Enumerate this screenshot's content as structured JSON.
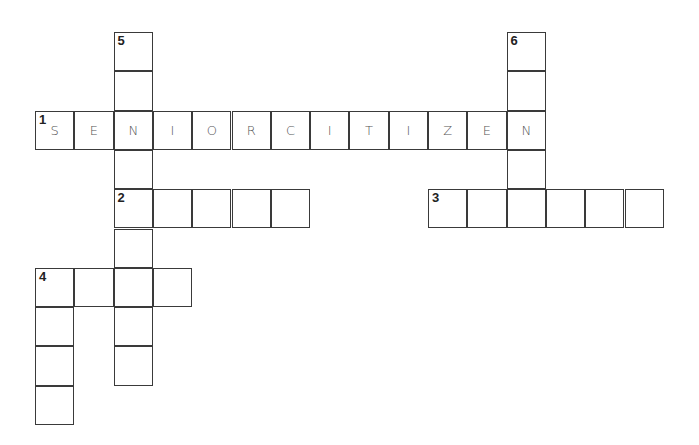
{
  "puzzle": {
    "cell_size": 39.3,
    "origin": {
      "x": 35,
      "y": 32
    },
    "entries": [
      {
        "number": "1",
        "direction": "across",
        "row": 2,
        "col": 0,
        "length": 13,
        "answer_shown": "SENIORCITIZEN"
      },
      {
        "number": "2",
        "direction": "across",
        "row": 4,
        "col": 2,
        "length": 5,
        "answer_shown": ""
      },
      {
        "number": "3",
        "direction": "across",
        "row": 4,
        "col": 10,
        "length": 6,
        "answer_shown": ""
      },
      {
        "number": "4",
        "direction": "across",
        "row": 6,
        "col": 0,
        "length": 4,
        "answer_shown": ""
      },
      {
        "number": "4",
        "direction": "down",
        "row": 6,
        "col": 0,
        "length": 4,
        "answer_shown": ""
      },
      {
        "number": "5",
        "direction": "down",
        "row": 0,
        "col": 2,
        "length": 9,
        "answer_shown": ""
      },
      {
        "number": "6",
        "direction": "down",
        "row": 0,
        "col": 12,
        "length": 5,
        "answer_shown": ""
      }
    ]
  }
}
